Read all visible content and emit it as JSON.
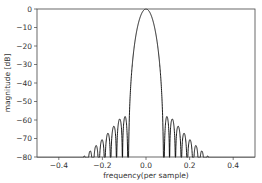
{
  "chart_data": {
    "type": "line",
    "title": "",
    "xlabel": "frequency(per sample)",
    "ylabel": "magnitude [dB]",
    "xlim": [
      -0.5,
      0.5
    ],
    "ylim": [
      -80,
      0
    ],
    "xticks": [
      -0.4,
      -0.2,
      0.0,
      0.2,
      0.4
    ],
    "xtick_labels": [
      "−0.4",
      "−0.2",
      "0.0",
      "0.2",
      "0.4"
    ],
    "yticks": [
      0,
      -10,
      -20,
      -30,
      -40,
      -50,
      -60,
      -70,
      -80
    ],
    "ytick_labels": [
      "0",
      "−10",
      "−20",
      "−30",
      "−40",
      "−50",
      "−60",
      "−70",
      "−80"
    ],
    "grid": false,
    "legend": null,
    "series": [
      {
        "name": "window frequency response",
        "color": "#000000",
        "generator": {
          "window": "blackman",
          "N": 38,
          "fft_points": 2048,
          "normalize_peak_db": 0
        },
        "main_lobe": {
          "peak_x": 0.0,
          "peak_y": 0,
          "first_null_x": [
            -0.08,
            0.08
          ]
        },
        "sidelobe_peaks": [
          {
            "x": 0.09,
            "y": -54
          },
          {
            "x": 0.115,
            "y": -60
          },
          {
            "x": 0.14,
            "y": -64.5
          },
          {
            "x": 0.165,
            "y": -67.5
          },
          {
            "x": 0.19,
            "y": -70
          },
          {
            "x": 0.215,
            "y": -73
          },
          {
            "x": 0.24,
            "y": -75
          },
          {
            "x": 0.265,
            "y": -77
          },
          {
            "x": 0.29,
            "y": -78.5
          }
        ],
        "symmetric": true
      }
    ]
  },
  "colors": {
    "line": "#000000",
    "axes": "#444444",
    "text": "#333333",
    "background": "#ffffff"
  }
}
